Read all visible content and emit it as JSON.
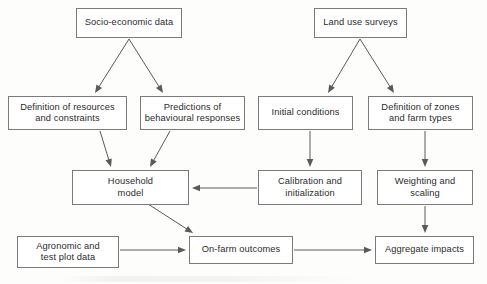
{
  "diagram": {
    "background_color": "#fdfdfc",
    "box_border_color": "#7b7b7b",
    "box_fill_color": "#ffffff",
    "text_color": "#2b2b2b",
    "edge_color": "#5a5a5a",
    "nodes": [
      {
        "id": "socio_economic_data",
        "label": "Socio-economic data",
        "x": 76,
        "y": 8,
        "w": 106,
        "h": 30
      },
      {
        "id": "land_use_surveys",
        "label": "Land use surveys",
        "x": 314,
        "y": 8,
        "w": 93,
        "h": 30
      },
      {
        "id": "definition_of_resources",
        "label": "Definition of resources\nand constraints",
        "x": 8,
        "y": 96,
        "w": 119,
        "h": 34
      },
      {
        "id": "predictions_behavioural",
        "label": "Predictions of\nbehavioural responses",
        "x": 140,
        "y": 96,
        "w": 105,
        "h": 34
      },
      {
        "id": "initial_conditions",
        "label": "Initial conditions",
        "x": 258,
        "y": 96,
        "w": 95,
        "h": 34
      },
      {
        "id": "definition_of_zones",
        "label": "Definition of zones\nand farm types",
        "x": 368,
        "y": 96,
        "w": 105,
        "h": 34
      },
      {
        "id": "household_model",
        "label": "Household\nmodel",
        "x": 72,
        "y": 170,
        "w": 117,
        "h": 35
      },
      {
        "id": "calibration_initialization",
        "label": "Calibration and\ninitialization",
        "x": 258,
        "y": 170,
        "w": 104,
        "h": 35
      },
      {
        "id": "weighting_scaling",
        "label": "Weighting and\nscaling",
        "x": 377,
        "y": 170,
        "w": 96,
        "h": 35
      },
      {
        "id": "agronomic_test_plot_data",
        "label": "Agronomic and\ntest plot data",
        "x": 17,
        "y": 236,
        "w": 102,
        "h": 32
      },
      {
        "id": "on_farm_outcomes",
        "label": "On-farm outcomes",
        "x": 189,
        "y": 236,
        "w": 104,
        "h": 28
      },
      {
        "id": "aggregate_impacts",
        "label": "Aggregate impacts",
        "x": 375,
        "y": 236,
        "w": 99,
        "h": 28
      }
    ],
    "edges": [
      {
        "id": "socio-to-definition",
        "from": "socio_economic_data",
        "to": "definition_of_resources",
        "x1": 129,
        "y1": 39,
        "x2": 95,
        "y2": 93
      },
      {
        "id": "socio-to-predictions",
        "from": "socio_economic_data",
        "to": "predictions_behavioural",
        "x1": 129,
        "y1": 39,
        "x2": 163,
        "y2": 93
      },
      {
        "id": "landuse-to-initial",
        "from": "land_use_surveys",
        "to": "initial_conditions",
        "x1": 360,
        "y1": 39,
        "x2": 328,
        "y2": 93
      },
      {
        "id": "landuse-to-zones",
        "from": "land_use_surveys",
        "to": "definition_of_zones",
        "x1": 360,
        "y1": 39,
        "x2": 394,
        "y2": 93
      },
      {
        "id": "definition-to-household",
        "from": "definition_of_resources",
        "to": "household_model",
        "x1": 100,
        "y1": 131,
        "x2": 111,
        "y2": 167
      },
      {
        "id": "predictions-to-household",
        "from": "predictions_behavioural",
        "to": "household_model",
        "x1": 170,
        "y1": 131,
        "x2": 150,
        "y2": 167
      },
      {
        "id": "initial-to-calibration",
        "from": "initial_conditions",
        "to": "calibration_initialization",
        "x1": 310,
        "y1": 131,
        "x2": 310,
        "y2": 167
      },
      {
        "id": "zones-to-weighting",
        "from": "definition_of_zones",
        "to": "weighting_scaling",
        "x1": 425,
        "y1": 131,
        "x2": 425,
        "y2": 167
      },
      {
        "id": "calibration-to-household",
        "from": "calibration_initialization",
        "to": "household_model",
        "x1": 257,
        "y1": 188,
        "x2": 192,
        "y2": 188
      },
      {
        "id": "household-to-onfarm",
        "from": "household_model",
        "to": "on_farm_outcomes",
        "x1": 148,
        "y1": 204,
        "x2": 193,
        "y2": 233
      },
      {
        "id": "weighting-to-aggregate",
        "from": "weighting_scaling",
        "to": "aggregate_impacts",
        "x1": 425,
        "y1": 206,
        "x2": 425,
        "y2": 233
      },
      {
        "id": "agronomic-to-onfarm",
        "from": "agronomic_test_plot_data",
        "to": "on_farm_outcomes",
        "x1": 120,
        "y1": 250,
        "x2": 186,
        "y2": 250
      },
      {
        "id": "onfarm-to-aggregate",
        "from": "on_farm_outcomes",
        "to": "aggregate_impacts",
        "x1": 294,
        "y1": 250,
        "x2": 372,
        "y2": 250
      }
    ]
  }
}
